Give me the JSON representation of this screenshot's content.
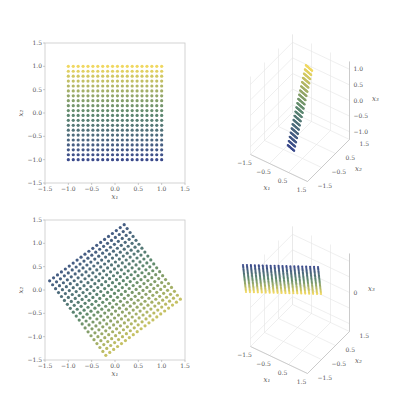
{
  "figure": {
    "width": 393,
    "height": 396,
    "background": "#ffffff"
  },
  "colormap": {
    "low": "#3b4a8c",
    "mid": "#5e8a6e",
    "high": "#f0d860"
  },
  "chart_data": [
    {
      "id": "top-left",
      "type": "scatter",
      "title": "",
      "xlabel": "x1",
      "ylabel": "x2",
      "xlim": [
        -1.5,
        1.5
      ],
      "ylim": [
        -1.5,
        1.5
      ],
      "xticks": [
        "-1.5",
        "-1.0",
        "-0.5",
        "0.0",
        "0.5",
        "1.0",
        "1.5"
      ],
      "yticks": [
        "-1.5",
        "-1.0",
        "-0.5",
        "0.0",
        "0.5",
        "1.0",
        "1.5"
      ],
      "grid": false,
      "points": {
        "grid_n": 20,
        "x_range": [
          -1,
          1
        ],
        "y_range": [
          -1,
          1
        ],
        "rotation_deg": 0
      },
      "color_by": "x2 (blue low -> yellow high)"
    },
    {
      "id": "top-right",
      "type": "scatter3d",
      "xlabel": "x1",
      "ylabel": "x2",
      "zlabel": "x3",
      "xticks": [
        "-1.5",
        "-0.5",
        "0.5",
        "1.5"
      ],
      "yticks": [
        "-1.5",
        "-0.5",
        "0.5",
        "1.5"
      ],
      "zticks": [
        "-1.0",
        "-0.5",
        "0.0",
        "0.5",
        "1.0"
      ],
      "grid": true,
      "description": "20x20 grid lying on tilted plane x3 = x2, colored by x2"
    },
    {
      "id": "bottom-left",
      "type": "scatter",
      "xlabel": "x1",
      "ylabel": "x2",
      "xlim": [
        -1.5,
        1.5
      ],
      "ylim": [
        -1.5,
        1.5
      ],
      "xticks": [
        "-1.5",
        "-1.0",
        "-0.5",
        "0.0",
        "0.5",
        "1.0",
        "1.5"
      ],
      "yticks": [
        "-1.5",
        "-1.0",
        "-0.5",
        "0.0",
        "0.5",
        "1.0",
        "1.5"
      ],
      "grid": false,
      "points": {
        "grid_n": 20,
        "x_range": [
          -1,
          1
        ],
        "y_range": [
          -1,
          1
        ],
        "rotation_deg": 37
      },
      "corners": [
        [
          0.2,
          1.4
        ],
        [
          -1.4,
          0.2
        ],
        [
          -0.2,
          -1.4
        ],
        [
          1.4,
          -0.2
        ]
      ],
      "color_by": "projection onto (0.6, -0.8): blue upper-left -> yellow lower-right"
    },
    {
      "id": "bottom-right",
      "type": "scatter3d",
      "xlabel": "x1",
      "ylabel": "x2",
      "zlabel": "x3",
      "xticks": [
        "-1.5",
        "-0.5",
        "0.5",
        "1.5"
      ],
      "yticks": [
        "-1.5",
        "-0.5",
        "0.5",
        "1.5"
      ],
      "zticks": [
        "0"
      ],
      "grid": true,
      "description": "20x20 grid flattened onto a plane near x3 = 0, blue far edge to yellow near edge"
    }
  ]
}
